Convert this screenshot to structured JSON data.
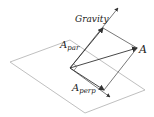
{
  "diagram": {
    "labels": {
      "gravity": "Gravity",
      "a": "A",
      "a_par_base": "A",
      "a_par_sub": "par",
      "a_perp_base": "A",
      "a_perp_sub": "perp"
    },
    "colors": {
      "plane": "#b8b8b8",
      "vector": "#333333",
      "guide": "#555555",
      "text": "#222222"
    }
  }
}
